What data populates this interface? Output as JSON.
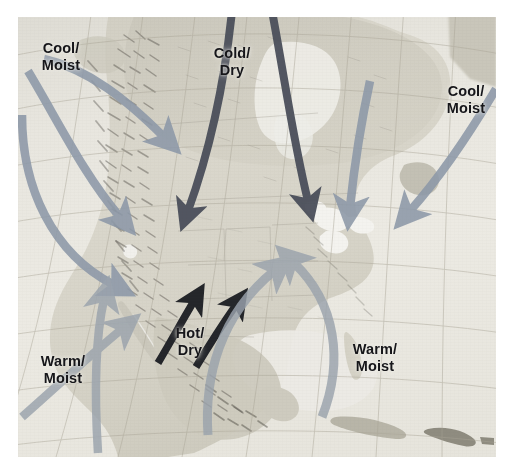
{
  "figure": {
    "type": "annotated-relief-map",
    "region": "North America",
    "background_color": "#ffffff",
    "map_background_color": "#e9e8e2"
  },
  "map": {
    "style": "shaded-relief",
    "graticule": {
      "visible": true,
      "color": "#b9b4a8",
      "description": "curved latitude and longitude lines"
    },
    "land_color": "#d7d4c9",
    "highland_color": "#9a968a",
    "water_color": "#f2f1ec"
  },
  "legend_colors": {
    "cool_moist_arrow": "#8c98a8",
    "cold_dry_arrow": "#4a4f5a",
    "warm_moist_arrow": "#9aa3ad",
    "hot_dry_arrow": "#1d1f24",
    "label_text": "#16161a"
  },
  "labels": [
    {
      "id": "cool-moist-northwest",
      "text": "Cool/\nMoist",
      "x": 30,
      "y": 40,
      "air_mass": "maritime polar (Pacific)",
      "temperature": "Cool",
      "moisture": "Moist"
    },
    {
      "id": "cold-dry-north",
      "text": "Cold/\nDry",
      "x": 207,
      "y": 45,
      "air_mass": "continental polar / arctic",
      "temperature": "Cold",
      "moisture": "Dry"
    },
    {
      "id": "cool-moist-northeast",
      "text": "Cool/\nMoist",
      "x": 437,
      "y": 83,
      "air_mass": "maritime polar (Atlantic)",
      "temperature": "Cool",
      "moisture": "Moist"
    },
    {
      "id": "hot-dry-southwest",
      "text": "Hot/\nDry",
      "x": 164,
      "y": 325,
      "air_mass": "continental tropical",
      "temperature": "Hot",
      "moisture": "Dry"
    },
    {
      "id": "warm-moist-southwest",
      "text": "Warm/\nMoist",
      "x": 32,
      "y": 353,
      "air_mass": "maritime tropical (Pacific)",
      "temperature": "Warm",
      "moisture": "Moist"
    },
    {
      "id": "warm-moist-southeast",
      "text": "Warm/\nMoist",
      "x": 342,
      "y": 341,
      "air_mass": "maritime tropical (Gulf / Atlantic)",
      "temperature": "Warm",
      "moisture": "Moist"
    }
  ],
  "arrows": [
    {
      "id": "arrow-cool-moist-nw-1",
      "group": "cool-moist-northwest",
      "color": "#8c98a8",
      "direction": "southeast",
      "description": "curving arrow from Pacific Northwest inland"
    },
    {
      "id": "arrow-cool-moist-nw-2",
      "group": "cool-moist-northwest",
      "color": "#8c98a8",
      "direction": "southeast",
      "description": "curving arrow from north Pacific into Great Basin"
    },
    {
      "id": "arrow-cool-moist-nw-3",
      "group": "cool-moist-northwest",
      "color": "#8c98a8",
      "direction": "southeast",
      "description": "long curving arrow along west coast"
    },
    {
      "id": "arrow-cold-dry-1",
      "group": "cold-dry-north",
      "color": "#4a4f5a",
      "direction": "south",
      "description": "arrow from central Canada into Great Plains"
    },
    {
      "id": "arrow-cold-dry-2",
      "group": "cold-dry-north",
      "color": "#4a4f5a",
      "direction": "south-southeast",
      "description": "arrow from Hudson Bay into Great Lakes"
    },
    {
      "id": "arrow-cool-moist-ne-1",
      "group": "cool-moist-northeast",
      "color": "#8c98a8",
      "direction": "southwest",
      "description": "arrow from Labrador toward New England"
    },
    {
      "id": "arrow-cool-moist-ne-2",
      "group": "cool-moist-northeast",
      "color": "#8c98a8",
      "direction": "southwest",
      "description": "arrow from North Atlantic toward northeast coast"
    },
    {
      "id": "arrow-hot-dry-1",
      "group": "hot-dry-southwest",
      "color": "#1d1f24",
      "direction": "northeast",
      "description": "arrow from northern Mexico into US Southwest"
    },
    {
      "id": "arrow-hot-dry-2",
      "group": "hot-dry-southwest",
      "color": "#1d1f24",
      "direction": "northeast",
      "description": "second arrow from northern Mexico into southern Plains"
    },
    {
      "id": "arrow-warm-moist-sw-1",
      "group": "warm-moist-southwest",
      "color": "#9aa3ad",
      "direction": "north-northeast",
      "description": "arrow from eastern Pacific toward Baja / California"
    },
    {
      "id": "arrow-warm-moist-sw-2",
      "group": "warm-moist-southwest",
      "color": "#9aa3ad",
      "direction": "northeast",
      "description": "arrow from tropical Pacific toward Mexico west coast"
    },
    {
      "id": "arrow-warm-moist-se-1",
      "group": "warm-moist-southeast",
      "color": "#9aa3ad",
      "direction": "north",
      "description": "arrow from Gulf of Mexico / Caribbean into southeast US"
    },
    {
      "id": "arrow-warm-moist-se-2",
      "group": "warm-moist-southeast",
      "color": "#9aa3ad",
      "direction": "northwest",
      "description": "arrow from subtropical Atlantic into southeast US"
    }
  ]
}
